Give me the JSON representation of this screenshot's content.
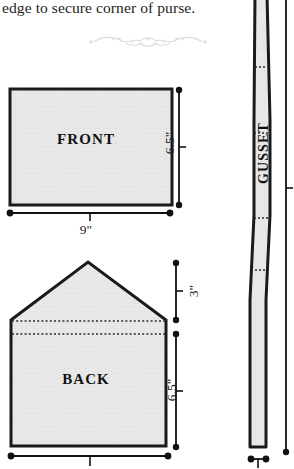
{
  "document": {
    "type": "sewing-pattern-diagram",
    "instruction_text": "edge to secure corner of purse.",
    "ornament_name": "decorative-flourish"
  },
  "pieces": [
    {
      "id": "front",
      "label": "FRONT",
      "shape": "rectangle",
      "width_label": "9\"",
      "height_label": "6.5\""
    },
    {
      "id": "back",
      "label": "BACK",
      "shape": "pentagon-flap",
      "flap_height_label": "3\"",
      "body_height_label": "6.5\"",
      "fold_lines": 2
    },
    {
      "id": "gusset",
      "label": "GUSSET",
      "shape": "tapered-strip",
      "fold_lines": 3
    }
  ],
  "dimensions": {
    "front_height": "6.5\"",
    "front_width": "9\"",
    "back_flap": "3\"",
    "back_body": "6.5\""
  },
  "colors": {
    "piece_fill": "#e9e9e9",
    "piece_stroke": "#1a1a1a",
    "fold_line": "#2a2a2a",
    "dimension_line": "#111111",
    "ornament": "#b8b8b8",
    "background": "#ffffff"
  }
}
